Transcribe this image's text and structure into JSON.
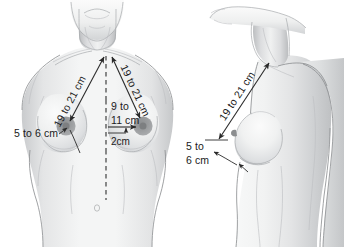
{
  "figure": {
    "background_color": "#ffffff",
    "ink_color": "#1b1b1b",
    "skin_color": "#eceded",
    "shade_color": "#cdcfd1",
    "nipple_color": "#9a9c9e"
  },
  "panels": [
    {
      "id": "frontal",
      "name": "frontal-view",
      "view_label": "Frontal view of female torso",
      "measurements": [
        {
          "id": "sternal-notch-to-left-nipple",
          "text": "19 to 21 cm",
          "orientation": "diagonal",
          "from": "sternal notch",
          "to": "nipple"
        },
        {
          "id": "sternal-notch-to-right-nipple",
          "text": "19 to 21 cm",
          "orientation": "diagonal",
          "from": "sternal notch",
          "to": "nipple"
        },
        {
          "id": "midline-to-nipple-horizontal",
          "text_line1": "9 to",
          "text_line2": "11 cm",
          "orientation": "horizontal",
          "from": "midline",
          "to": "nipple"
        },
        {
          "id": "areola-offset",
          "text": "2cm",
          "orientation": "horizontal"
        },
        {
          "id": "nipple-to-inframammary-fold",
          "text": "5 to 6 cm",
          "orientation": "horizontal-leader",
          "from": "nipple",
          "to": "inframammary fold"
        }
      ]
    },
    {
      "id": "lateral",
      "name": "lateral-view",
      "view_label": "Lateral (profile) view of female torso",
      "measurements": [
        {
          "id": "clavicle-to-nipple-lateral",
          "text": "19 to 21 cm",
          "orientation": "diagonal",
          "from": "clavicle",
          "to": "nipple"
        },
        {
          "id": "nipple-to-fold-lateral",
          "text_line1": "5 to",
          "text_line2": "6 cm",
          "orientation": "stacked-leader",
          "from": "nipple",
          "to": "inframammary fold"
        }
      ]
    }
  ]
}
